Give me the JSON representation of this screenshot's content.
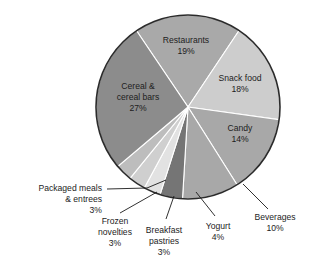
{
  "chart_data": {
    "type": "pie",
    "title": "",
    "subtitle": "",
    "xlabel": "",
    "ylabel": "",
    "legend_position": "none",
    "grid": false,
    "units": "percent",
    "total": 101,
    "start_angle_deg": -34,
    "direction": "clockwise",
    "categories": [
      "Restaurants",
      "Snack food",
      "Candy",
      "Beverages",
      "Yogurt",
      "Breakfast pastries",
      "Frozen novelties",
      "Packaged meals & entrees",
      "Cereal & cereal bars"
    ],
    "values": [
      19,
      18,
      14,
      10,
      4,
      3,
      3,
      3,
      27
    ],
    "value_labels": [
      "19%",
      "18%",
      "14%",
      "10%",
      "4%",
      "3%",
      "3%",
      "3%",
      "27%"
    ],
    "colors": [
      "#a9a9a9",
      "#cdcdcd",
      "#a8a8a8",
      "#a8a8a8",
      "#757575",
      "#e2e2e2",
      "#cfcfcf",
      "#bdbdbd",
      "#8c8c8c"
    ],
    "slices": [
      {
        "name": "Restaurants",
        "value": 19,
        "value_label": "19%",
        "color": "#a9a9a9",
        "label_inside": true,
        "label_lines": [
          "Restaurants",
          "19%"
        ]
      },
      {
        "name": "Snack food",
        "value": 18,
        "value_label": "18%",
        "color": "#cdcdcd",
        "label_inside": true,
        "label_lines": [
          "Snack food",
          "18%"
        ]
      },
      {
        "name": "Candy",
        "value": 14,
        "value_label": "14%",
        "color": "#a8a8a8",
        "label_inside": true,
        "label_lines": [
          "Candy",
          "14%"
        ]
      },
      {
        "name": "Beverages",
        "value": 10,
        "value_label": "10%",
        "color": "#a8a8a8",
        "label_inside": false,
        "label_lines": [
          "Beverages",
          "10%"
        ]
      },
      {
        "name": "Yogurt",
        "value": 4,
        "value_label": "4%",
        "color": "#757575",
        "label_inside": false,
        "label_lines": [
          "Yogurt",
          "4%"
        ]
      },
      {
        "name": "Breakfast pastries",
        "value": 3,
        "value_label": "3%",
        "color": "#e2e2e2",
        "label_inside": false,
        "label_lines": [
          "Breakfast",
          "pastries",
          "3%"
        ]
      },
      {
        "name": "Frozen novelties",
        "value": 3,
        "value_label": "3%",
        "color": "#cfcfcf",
        "label_inside": false,
        "label_lines": [
          "Frozen",
          "novelties",
          "3%"
        ]
      },
      {
        "name": "Packaged meals & entrees",
        "value": 3,
        "value_label": "3%",
        "color": "#bdbdbd",
        "label_inside": false,
        "label_lines": [
          "Packaged meals",
          "& entrees",
          "3%"
        ]
      },
      {
        "name": "Cereal & cereal bars",
        "value": 27,
        "value_label": "27%",
        "color": "#8c8c8c",
        "label_inside": true,
        "label_lines": [
          "Cereal &",
          "cereal bars",
          "27%"
        ]
      }
    ]
  },
  "labels": {
    "restaurants_name": "Restaurants",
    "restaurants_pct": "19%",
    "snack_food_name": "Snack food",
    "snack_food_pct": "18%",
    "candy_name": "Candy",
    "candy_pct": "14%",
    "cereal_name_1": "Cereal &",
    "cereal_name_2": "cereal bars",
    "cereal_pct": "27%",
    "beverages_name": "Beverages",
    "beverages_pct": "10%",
    "yogurt_name": "Yogurt",
    "yogurt_pct": "4%",
    "breakfast_name_1": "Breakfast",
    "breakfast_name_2": "pastries",
    "breakfast_pct": "3%",
    "frozen_name_1": "Frozen",
    "frozen_name_2": "novelties",
    "frozen_pct": "3%",
    "packaged_name_1": "Packaged meals",
    "packaged_name_2": "& entrees",
    "packaged_pct": "3%"
  },
  "theme": {
    "background": "#ffffff",
    "text_color": "#1d1d1d",
    "outline_color": "#2b2b2b",
    "separator_color": "#ffffff"
  }
}
